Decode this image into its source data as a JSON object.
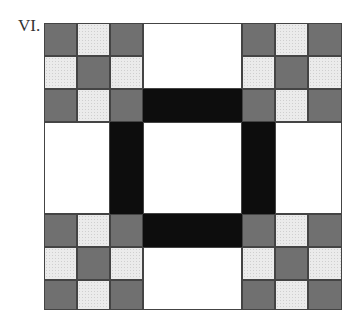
{
  "figure": {
    "label": "VI.",
    "colors": {
      "dark": "#707070",
      "light": "#ebebeb",
      "white": "#ffffff",
      "black": "#0d0d0d"
    },
    "grid": {
      "cols": [
        44,
        77,
        110,
        143,
        242,
        275,
        308,
        342
      ],
      "rows": [
        23,
        56,
        89,
        122,
        214,
        247,
        280,
        310
      ]
    },
    "cells": [
      {
        "c": 0,
        "r": 0,
        "t": "dark"
      },
      {
        "c": 1,
        "r": 0,
        "t": "light"
      },
      {
        "c": 2,
        "r": 0,
        "t": "dark"
      },
      {
        "c": 0,
        "r": 1,
        "t": "light"
      },
      {
        "c": 1,
        "r": 1,
        "t": "dark"
      },
      {
        "c": 2,
        "r": 1,
        "t": "light"
      },
      {
        "c": 0,
        "r": 2,
        "t": "dark"
      },
      {
        "c": 1,
        "r": 2,
        "t": "light"
      },
      {
        "c": 2,
        "r": 2,
        "t": "dark"
      },
      {
        "c": 4,
        "r": 0,
        "t": "dark"
      },
      {
        "c": 5,
        "r": 0,
        "t": "light"
      },
      {
        "c": 6,
        "r": 0,
        "t": "dark"
      },
      {
        "c": 4,
        "r": 1,
        "t": "light"
      },
      {
        "c": 5,
        "r": 1,
        "t": "dark"
      },
      {
        "c": 6,
        "r": 1,
        "t": "light"
      },
      {
        "c": 4,
        "r": 2,
        "t": "dark"
      },
      {
        "c": 5,
        "r": 2,
        "t": "light"
      },
      {
        "c": 6,
        "r": 2,
        "t": "dark"
      },
      {
        "c": 0,
        "r": 4,
        "t": "dark"
      },
      {
        "c": 1,
        "r": 4,
        "t": "light"
      },
      {
        "c": 2,
        "r": 4,
        "t": "dark"
      },
      {
        "c": 0,
        "r": 5,
        "t": "light"
      },
      {
        "c": 1,
        "r": 5,
        "t": "dark"
      },
      {
        "c": 2,
        "r": 5,
        "t": "light"
      },
      {
        "c": 0,
        "r": 6,
        "t": "dark"
      },
      {
        "c": 1,
        "r": 6,
        "t": "light"
      },
      {
        "c": 2,
        "r": 6,
        "t": "dark"
      },
      {
        "c": 4,
        "r": 4,
        "t": "dark"
      },
      {
        "c": 5,
        "r": 4,
        "t": "light"
      },
      {
        "c": 6,
        "r": 4,
        "t": "dark"
      },
      {
        "c": 4,
        "r": 5,
        "t": "light"
      },
      {
        "c": 5,
        "r": 5,
        "t": "dark"
      },
      {
        "c": 6,
        "r": 5,
        "t": "light"
      },
      {
        "c": 4,
        "r": 6,
        "t": "dark"
      },
      {
        "c": 5,
        "r": 6,
        "t": "light"
      },
      {
        "c": 6,
        "r": 6,
        "t": "dark"
      }
    ],
    "bars": [
      {
        "x": 143,
        "y": 89,
        "w": 99,
        "h": 33,
        "t": "black",
        "name": "frame-top-bar"
      },
      {
        "x": 143,
        "y": 214,
        "w": 99,
        "h": 33,
        "t": "black",
        "name": "frame-bottom-bar"
      },
      {
        "x": 110,
        "y": 122,
        "w": 33,
        "h": 92,
        "t": "black",
        "name": "frame-left-bar"
      },
      {
        "x": 242,
        "y": 122,
        "w": 33,
        "h": 92,
        "t": "black",
        "name": "frame-right-bar"
      },
      {
        "x": 143,
        "y": 23,
        "w": 99,
        "h": 66,
        "t": "white",
        "name": "top-center-panel"
      },
      {
        "x": 143,
        "y": 247,
        "w": 99,
        "h": 63,
        "t": "white",
        "name": "bottom-center-panel"
      },
      {
        "x": 44,
        "y": 122,
        "w": 66,
        "h": 92,
        "t": "white",
        "name": "left-center-panel"
      },
      {
        "x": 275,
        "y": 122,
        "w": 67,
        "h": 92,
        "t": "white",
        "name": "right-center-panel"
      },
      {
        "x": 143,
        "y": 122,
        "w": 99,
        "h": 92,
        "t": "white",
        "name": "center-square"
      }
    ]
  }
}
